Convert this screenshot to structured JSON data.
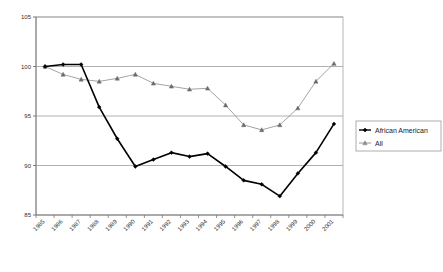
{
  "chart_data": {
    "type": "line",
    "title": "",
    "subtitle": "",
    "xlabel": "",
    "ylabel": "",
    "x": [
      "1985",
      "1986",
      "1987",
      "1988",
      "1989",
      "1990",
      "1991",
      "1992",
      "1993",
      "1994",
      "1995",
      "1996",
      "1997",
      "1998",
      "1999",
      "2000",
      "2001"
    ],
    "categories": [
      "1985",
      "1986",
      "1987",
      "1988",
      "1989",
      "1990",
      "1991",
      "1992",
      "1993",
      "1994",
      "1995",
      "1996",
      "1997",
      "1998",
      "1999",
      "2000",
      "2001"
    ],
    "xtick_labels": [
      "1985",
      "1986",
      "1987",
      "1988",
      "1989",
      "1990",
      "1991",
      "1992",
      "1993",
      "1994",
      "1995",
      "1996",
      "1997",
      "1998",
      "1999",
      "2000",
      "2001"
    ],
    "ytick_labels": [
      "85",
      "90",
      "95",
      "100",
      "105"
    ],
    "yticks": [
      85,
      90,
      95,
      100,
      105
    ],
    "ylim": [
      85,
      105
    ],
    "grid": "horizontal",
    "legend_position": "right",
    "series": [
      {
        "name": "African American",
        "color": "#000000",
        "marker": "diamond",
        "marker_color": "#000000",
        "line_width": 1.6,
        "values": [
          100.0,
          100.2,
          100.2,
          95.9,
          92.7,
          89.9,
          90.6,
          91.3,
          90.9,
          91.2,
          89.9,
          88.5,
          88.1,
          86.9,
          89.2,
          91.3,
          94.2
        ]
      },
      {
        "name": "All",
        "color": "#8c8c8c",
        "marker": "triangle",
        "marker_color": "#6b6b6b",
        "line_width": 0.8,
        "values": [
          100.0,
          99.2,
          98.7,
          98.5,
          98.8,
          99.2,
          98.3,
          98.0,
          97.7,
          97.8,
          96.1,
          94.1,
          93.6,
          94.1,
          95.8,
          98.5,
          100.3
        ]
      }
    ]
  },
  "legend": {
    "items": [
      {
        "label": "African American",
        "marker": "diamond",
        "color": "#000000"
      },
      {
        "label": "All",
        "marker": "triangle",
        "color": "#8c8c8c"
      }
    ]
  },
  "axes": {
    "y_labels": [
      "105",
      "100",
      "95",
      "90",
      "85"
    ],
    "x_labels": [
      "1985",
      "1986",
      "1987",
      "1988",
      "1989",
      "1990",
      "1991",
      "1992",
      "1993",
      "1994",
      "1995",
      "1996",
      "1997",
      "1998",
      "1999",
      "2000",
      "2001"
    ]
  },
  "colors": {
    "series_african_american": "#000000",
    "series_all": "#8c8c8c",
    "gridline": "#9e9e9e",
    "plot_border": "#b5b5b5",
    "axis": "#7a7a7a",
    "background": "#ffffff"
  }
}
